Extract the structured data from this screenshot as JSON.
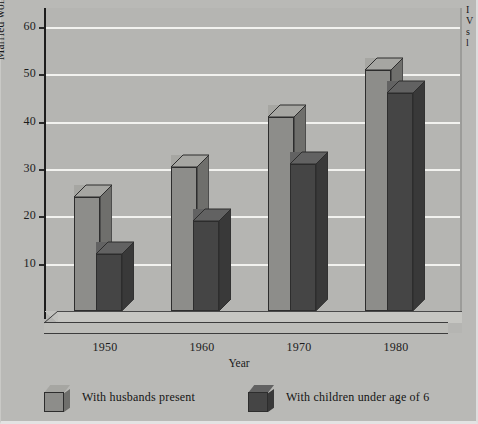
{
  "chart_data": {
    "type": "bar",
    "title": "",
    "xlabel": "Year",
    "ylabel": "Married women in the work force",
    "categories": [
      "1950",
      "1960",
      "1970",
      "1980"
    ],
    "series": [
      {
        "name": "With husbands present",
        "values": [
          24,
          30.5,
          41,
          51
        ],
        "color": "#8d8d8a"
      },
      {
        "name": "With children under age of 6",
        "values": [
          12,
          19,
          31,
          46
        ],
        "color": "#454545"
      }
    ],
    "ylim": [
      0,
      64
    ],
    "yticks": [
      10,
      20,
      30,
      40,
      50,
      60
    ],
    "ytick_labels": [
      "10",
      "20",
      "30",
      "40",
      "50",
      "60"
    ],
    "grid": true,
    "legend_position": "bottom",
    "style": "3d-bars-grayscale"
  },
  "axes": {
    "y_title": "Married women in the work force",
    "x_title": "Year"
  },
  "legend": {
    "entries": [
      {
        "label": "With husbands present",
        "swatch": "light"
      },
      {
        "label": "With children under age of 6",
        "swatch": "dark"
      }
    ]
  },
  "margin_note": {
    "lines": [
      "I",
      "V",
      "s",
      "l"
    ]
  },
  "colors": {
    "page_background": "#b9b9b6",
    "plot_background": "#b5b5b2",
    "gridline": "#f2f2ef",
    "axis": "#1d1d1d",
    "series_light": "#8d8d8a",
    "series_dark": "#454545"
  }
}
